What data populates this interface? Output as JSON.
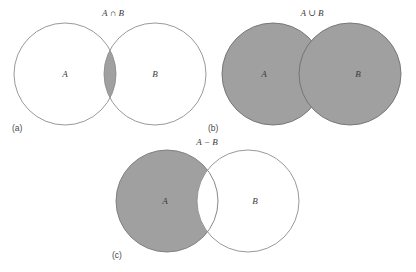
{
  "figure": {
    "background_color": "#ffffff",
    "stroke_color": "#8d8d8d",
    "shade_color": "#a0a0a0",
    "text_color": "#3a3a3a",
    "width": 416,
    "height": 272
  },
  "panels": [
    {
      "key": "a",
      "panel_label": "(a)",
      "operation_label": "A ∩ B",
      "operation_name": "intersection",
      "set_a_label": "A",
      "set_b_label": "B",
      "shaded_region": "intersection",
      "circle_a": {
        "cx": 65,
        "cy": 74,
        "r": 51
      },
      "circle_b": {
        "cx": 155,
        "cy": 74,
        "r": 51
      }
    },
    {
      "key": "b",
      "panel_label": "(b)",
      "operation_label": "A ∪ B",
      "operation_name": "union",
      "set_a_label": "A",
      "set_b_label": "B",
      "shaded_region": "union",
      "circle_a": {
        "cx": 273,
        "cy": 74,
        "r": 51
      },
      "circle_b": {
        "cx": 350,
        "cy": 74,
        "r": 51
      }
    },
    {
      "key": "c",
      "panel_label": "(c)",
      "operation_label": "A − B",
      "operation_name": "difference",
      "set_a_label": "A",
      "set_b_label": "B",
      "shaded_region": "a-minus-b",
      "circle_a": {
        "cx": 167,
        "cy": 201,
        "r": 51
      },
      "circle_b": {
        "cx": 248,
        "cy": 201,
        "r": 51
      }
    }
  ],
  "labels": {
    "op_a": "A ∩ B",
    "op_b": "A ∪ B",
    "op_c": "A − B",
    "panel_a": "(a)",
    "panel_b": "(b)",
    "panel_c": "(c)",
    "a_letter": "A",
    "b_letter": "B"
  }
}
